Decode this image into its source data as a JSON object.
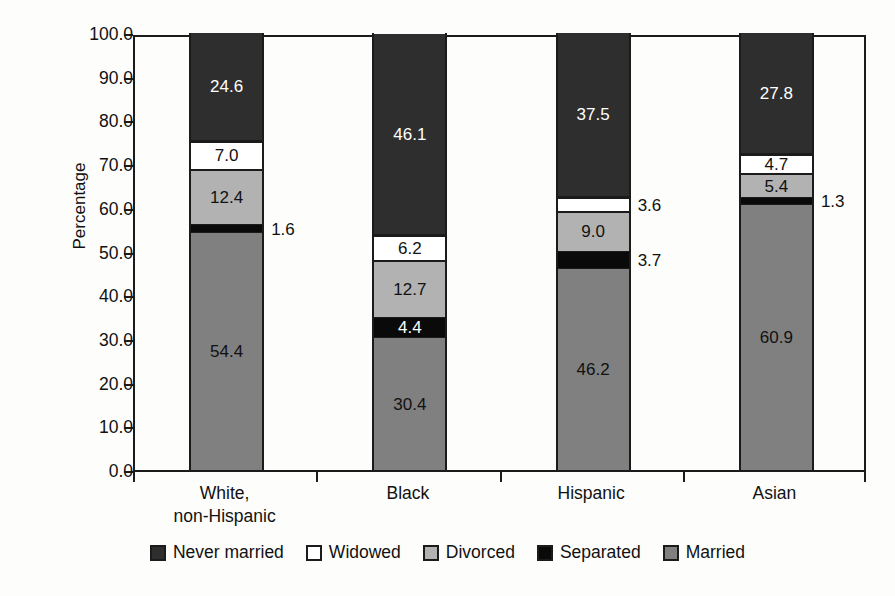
{
  "chart_data": {
    "type": "bar",
    "subtype": "stacked-100",
    "title": "",
    "xlabel": "",
    "ylabel": "Percentage",
    "ylim": [
      0,
      100
    ],
    "ytick_step": 10,
    "ytick_labels": [
      "100.0",
      "90.0",
      "80.0",
      "70.0",
      "60.0",
      "50.0",
      "40.0",
      "30.0",
      "20.0",
      "10.0",
      "0.0"
    ],
    "grid": false,
    "legend_position": "bottom",
    "categories": [
      "White, non-Hispanic",
      "Black",
      "Hispanic",
      "Asian"
    ],
    "category_lines": [
      [
        "White,",
        "non-Hispanic"
      ],
      [
        "Black"
      ],
      [
        "Hispanic"
      ],
      [
        "Asian"
      ]
    ],
    "series": [
      {
        "name": "Never married",
        "color": "#2e2e2e",
        "values": [
          24.6,
          46.1,
          37.5,
          27.8
        ]
      },
      {
        "name": "Widowed",
        "color": "#ffffff",
        "values": [
          7.0,
          6.2,
          3.6,
          4.7
        ]
      },
      {
        "name": "Divorced",
        "color": "#b2b2b2",
        "values": [
          12.4,
          12.7,
          9.0,
          5.4
        ]
      },
      {
        "name": "Separated",
        "color": "#0a0a0a",
        "values": [
          1.6,
          4.4,
          3.7,
          1.3
        ]
      },
      {
        "name": "Married",
        "color": "#808080",
        "values": [
          54.4,
          30.4,
          46.2,
          60.9
        ]
      }
    ],
    "bars": [
      {
        "category": "White, non-Hispanic",
        "segments": [
          {
            "name": "Married",
            "value": 54.4,
            "label": "54.4",
            "label_placement": "inside"
          },
          {
            "name": "Separated",
            "value": 1.6,
            "label": "1.6",
            "label_placement": "outside"
          },
          {
            "name": "Divorced",
            "value": 12.4,
            "label": "12.4",
            "label_placement": "inside"
          },
          {
            "name": "Widowed",
            "value": 7.0,
            "label": "7.0",
            "label_placement": "inside"
          },
          {
            "name": "Never married",
            "value": 24.6,
            "label": "24.6",
            "label_placement": "inside"
          }
        ]
      },
      {
        "category": "Black",
        "segments": [
          {
            "name": "Married",
            "value": 30.4,
            "label": "30.4",
            "label_placement": "inside"
          },
          {
            "name": "Separated",
            "value": 4.4,
            "label": "4.4",
            "label_placement": "inside"
          },
          {
            "name": "Divorced",
            "value": 12.7,
            "label": "12.7",
            "label_placement": "inside"
          },
          {
            "name": "Widowed",
            "value": 6.2,
            "label": "6.2",
            "label_placement": "inside"
          },
          {
            "name": "Never married",
            "value": 46.1,
            "label": "46.1",
            "label_placement": "inside"
          }
        ]
      },
      {
        "category": "Hispanic",
        "segments": [
          {
            "name": "Married",
            "value": 46.2,
            "label": "46.2",
            "label_placement": "inside"
          },
          {
            "name": "Separated",
            "value": 3.7,
            "label": "3.7",
            "label_placement": "outside"
          },
          {
            "name": "Divorced",
            "value": 9.0,
            "label": "9.0",
            "label_placement": "inside"
          },
          {
            "name": "Widowed",
            "value": 3.6,
            "label": "3.6",
            "label_placement": "outside"
          },
          {
            "name": "Never married",
            "value": 37.5,
            "label": "37.5",
            "label_placement": "inside"
          }
        ]
      },
      {
        "category": "Asian",
        "segments": [
          {
            "name": "Married",
            "value": 60.9,
            "label": "60.9",
            "label_placement": "inside"
          },
          {
            "name": "Separated",
            "value": 1.3,
            "label": "1.3",
            "label_placement": "outside"
          },
          {
            "name": "Divorced",
            "value": 5.4,
            "label": "5.4",
            "label_placement": "inside"
          },
          {
            "name": "Widowed",
            "value": 4.7,
            "label": "4.7",
            "label_placement": "inside"
          },
          {
            "name": "Never married",
            "value": 27.8,
            "label": "27.8",
            "label_placement": "inside"
          }
        ]
      }
    ],
    "legend": [
      {
        "label": "Never married",
        "color": "#2e2e2e"
      },
      {
        "label": "Widowed",
        "color": "#ffffff"
      },
      {
        "label": "Divorced",
        "color": "#b2b2b2"
      },
      {
        "label": "Separated",
        "color": "#0a0a0a"
      },
      {
        "label": "Married",
        "color": "#808080"
      }
    ]
  },
  "axis": {
    "y_title": "Percentage"
  },
  "artifacts": {
    "speckle_1": "",
    "speckle_2": ""
  }
}
